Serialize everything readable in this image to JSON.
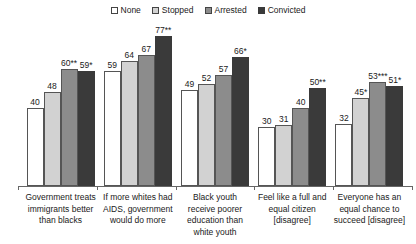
{
  "chart_data": {
    "type": "bar",
    "title": "",
    "xlabel": "",
    "ylabel": "",
    "ylim": [
      0,
      85
    ],
    "grid": false,
    "legend_position": "top-center",
    "categories": [
      "Government treats immigrants better than blacks",
      "If more whites had AIDS, government would do more",
      "Black youth receive poorer education than white youth",
      "Feel like a full and equal citizen [disagree]",
      "Everyone has an equal chance to succeed [disagree]"
    ],
    "series": [
      {
        "name": "None",
        "color": "#ffffff",
        "values": [
          40,
          59,
          49,
          30,
          32
        ],
        "labels": [
          "40",
          "59",
          "49",
          "30",
          "32"
        ]
      },
      {
        "name": "Stopped",
        "color": "#d2d2d2",
        "values": [
          48,
          64,
          52,
          31,
          45
        ],
        "labels": [
          "48",
          "64",
          "52",
          "31",
          "45*"
        ]
      },
      {
        "name": "Arrested",
        "color": "#8c8c8c",
        "values": [
          60,
          67,
          57,
          40,
          53
        ],
        "labels": [
          "60**",
          "67",
          "57",
          "40",
          "53***"
        ]
      },
      {
        "name": "Convicted",
        "color": "#3a3a3a",
        "values": [
          59,
          77,
          66,
          50,
          51
        ],
        "labels": [
          "59*",
          "77**",
          "66*",
          "50**",
          "51*"
        ]
      }
    ]
  },
  "legend": {
    "items": [
      {
        "label": "None"
      },
      {
        "label": "Stopped"
      },
      {
        "label": "Arrested"
      },
      {
        "label": "Convicted"
      }
    ]
  }
}
